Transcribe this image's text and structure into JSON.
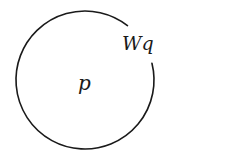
{
  "diagram": {
    "circle": {
      "cx": 85,
      "cy": 80,
      "r": 69,
      "stroke": "#1a1a1a",
      "gap_start_angle_deg": -52,
      "gap_end_angle_deg": -14
    },
    "labels": {
      "center": "p",
      "boundary": "Wq"
    }
  }
}
